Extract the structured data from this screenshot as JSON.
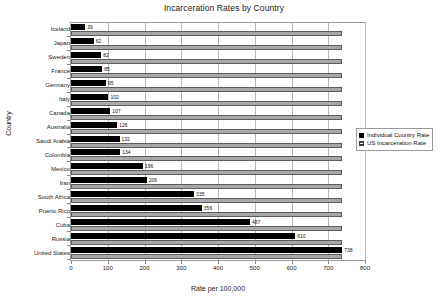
{
  "chart_data": {
    "type": "bar",
    "orientation": "horizontal",
    "title": "Incarceration Rates by Country",
    "xlabel": "Rate per 100,000",
    "ylabel": "Country",
    "xlim": [
      0,
      800
    ],
    "xticks": [
      0,
      100,
      200,
      300,
      400,
      500,
      600,
      700,
      800
    ],
    "grid": true,
    "legend_position": "right",
    "categories": [
      "Iceland",
      "Japan",
      "Sweden",
      "France",
      "Germany",
      "Italy",
      "Canada",
      "Australia",
      "Saudi Arabia",
      "Colombia",
      "Mexico",
      "Iran",
      "South Africa",
      "Puerto Rico",
      "Cuba",
      "Russia",
      "United States"
    ],
    "series": [
      {
        "name": "Individual Country Rate",
        "color": "#000000",
        "values": [
          39,
          62,
          82,
          85,
          95,
          102,
          107,
          126,
          132,
          134,
          196,
          206,
          335,
          356,
          487,
          610,
          738
        ]
      },
      {
        "name": "US Incarceration Rate",
        "color": "#a8a8a8",
        "values": [
          738,
          738,
          738,
          738,
          738,
          738,
          738,
          738,
          738,
          738,
          738,
          738,
          738,
          738,
          738,
          738,
          738
        ]
      }
    ],
    "data_labels": [
      "39",
      "62",
      "82",
      "85",
      "95",
      "102",
      "107",
      "126",
      "132",
      "134",
      "196",
      "206",
      "335",
      "356",
      "487",
      "610",
      "738"
    ]
  },
  "legend": {
    "items": [
      {
        "label": "Individual Country Rate",
        "swatch": "solid-black-square"
      },
      {
        "label": "US Incarceration Rate",
        "swatch": "hatched-square"
      }
    ]
  }
}
